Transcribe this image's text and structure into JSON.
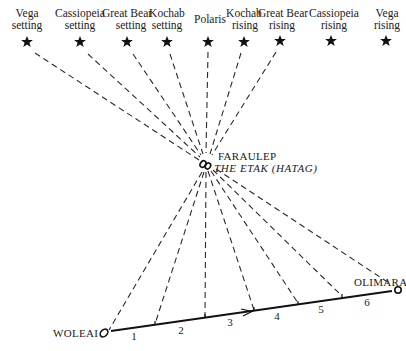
{
  "stars": [
    {
      "name": "Vega",
      "sub": "setting",
      "x": 27,
      "y": 42
    },
    {
      "name": "Cassiopeia",
      "sub": "setting",
      "x": 80,
      "y": 42
    },
    {
      "name": "Great Bear",
      "sub": "setting",
      "x": 127,
      "y": 42
    },
    {
      "name": "Kochab",
      "sub": "setting",
      "x": 167,
      "y": 42
    },
    {
      "name": "Polaris",
      "sub": "",
      "x": 208,
      "y": 42
    },
    {
      "name": "Kochab",
      "sub": "rising",
      "x": 244,
      "y": 42
    },
    {
      "name": "Great Bear",
      "sub": "rising",
      "x": 280,
      "y": 41
    },
    {
      "name": "Cassiopeia",
      "sub": "rising",
      "x": 331,
      "y": 41
    },
    {
      "name": "Vega",
      "sub": "rising",
      "x": 386,
      "y": 41
    }
  ],
  "reference_island": {
    "name": "FARAULEP",
    "subtitle": "THE ETAK (HATAG)",
    "x": 206,
    "y": 164
  },
  "origin": {
    "name": "WOLEAI",
    "x": 103,
    "y": 333
  },
  "destination": {
    "name": "OLIMARA",
    "x": 398,
    "y": 290
  },
  "etak_segments": [
    {
      "label": "1",
      "tick": [
        155,
        325
      ]
    },
    {
      "label": "2",
      "tick": [
        205,
        318
      ]
    },
    {
      "label": "3",
      "tick": [
        254,
        311
      ]
    },
    {
      "label": "4",
      "tick": [
        298,
        304
      ]
    },
    {
      "label": "5",
      "tick": [
        342,
        297
      ]
    },
    {
      "label": "6",
      "tick": null
    }
  ],
  "segment_numbers": [
    "1",
    "2",
    "3",
    "4",
    "5",
    "6"
  ],
  "colors": {
    "ink": "#1a1a1a",
    "background": "#ffffff"
  }
}
